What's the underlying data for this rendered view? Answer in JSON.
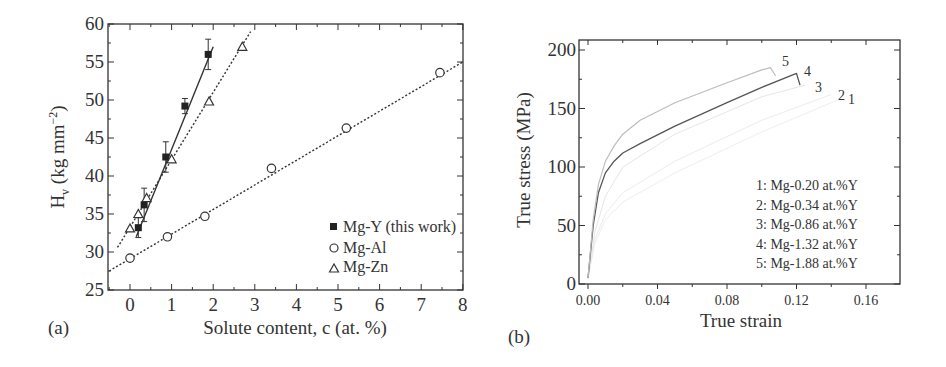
{
  "chart_data": [
    {
      "panel": "(a)",
      "type": "scatter",
      "title": "",
      "xlabel": "Solute content, c (at. %)",
      "ylabel": "H_v (kg mm^-2)",
      "xlim": [
        -0.5,
        8
      ],
      "ylim": [
        25,
        60
      ],
      "xticks": [
        0,
        1,
        2,
        3,
        4,
        5,
        6,
        7,
        8
      ],
      "yticks": [
        25,
        30,
        35,
        40,
        45,
        50,
        55,
        60
      ],
      "legend_position": "lower right",
      "series": [
        {
          "name": "Mg-Y (this work)",
          "marker": "filled-square",
          "fit": "solid",
          "x": [
            0.2,
            0.34,
            0.86,
            1.32,
            1.88
          ],
          "y": [
            33.2,
            36.2,
            42.5,
            49.2,
            56.0
          ],
          "yerr": [
            1.3,
            2.2,
            2.0,
            1.0,
            2.0
          ],
          "fit_line": [
            [
              0.15,
              32.0
            ],
            [
              2.0,
              57.0
            ]
          ]
        },
        {
          "name": "Mg-Al",
          "marker": "open-circle",
          "fit": "dotted",
          "x": [
            0.0,
            0.9,
            1.8,
            3.4,
            5.2,
            7.45
          ],
          "y": [
            29.2,
            32.0,
            34.7,
            41.0,
            46.3,
            53.6
          ],
          "fit_line": [
            [
              -0.5,
              27.5
            ],
            [
              8.0,
              55.0
            ]
          ]
        },
        {
          "name": "Mg-Zn",
          "marker": "open-triangle",
          "fit": "dotted",
          "x": [
            0.0,
            0.2,
            0.4,
            1.0,
            1.9,
            2.7
          ],
          "y": [
            33.1,
            35.0,
            37.1,
            42.2,
            49.8,
            57.0
          ],
          "fit_line": [
            [
              -0.3,
              30.6
            ],
            [
              2.9,
              59.0
            ]
          ]
        }
      ]
    },
    {
      "panel": "(b)",
      "type": "line",
      "title": "",
      "xlabel": "True strain",
      "ylabel": "True stress (MPa)",
      "xlim": [
        -0.008,
        0.178
      ],
      "ylim": [
        0,
        210
      ],
      "xticks": [
        "0.00",
        "0.04",
        "0.08",
        "0.12",
        "0.16"
      ],
      "yticks": [
        0,
        50,
        100,
        150,
        200
      ],
      "legend_position": "lower right (text list)",
      "series": [
        {
          "name": "1: Mg-0.20 at.%Y",
          "label": "1",
          "x": [
            0.0,
            0.004,
            0.01,
            0.02,
            0.05,
            0.1,
            0.145
          ],
          "y": [
            5,
            35,
            55,
            70,
            95,
            130,
            158
          ]
        },
        {
          "name": "2: Mg-0.34 at.%Y",
          "label": "2",
          "x": [
            0.0,
            0.004,
            0.01,
            0.02,
            0.05,
            0.1,
            0.14
          ],
          "y": [
            5,
            38,
            60,
            78,
            105,
            140,
            162
          ]
        },
        {
          "name": "3: Mg-0.86 at.%Y",
          "label": "3",
          "x": [
            0.0,
            0.004,
            0.01,
            0.02,
            0.05,
            0.1,
            0.125
          ],
          "y": [
            5,
            45,
            75,
            100,
            128,
            160,
            170
          ]
        },
        {
          "name": "4: Mg-1.32 at.%Y",
          "label": "4",
          "x": [
            0.0,
            0.003,
            0.006,
            0.01,
            0.015,
            0.02,
            0.03,
            0.05,
            0.08,
            0.1,
            0.12,
            0.122
          ],
          "y": [
            5,
            50,
            78,
            95,
            105,
            112,
            120,
            135,
            155,
            168,
            180,
            170
          ]
        },
        {
          "name": "5: Mg-1.88 at.%Y",
          "label": "5",
          "x": [
            0.0,
            0.003,
            0.006,
            0.01,
            0.015,
            0.02,
            0.03,
            0.05,
            0.08,
            0.1,
            0.105,
            0.108
          ],
          "y": [
            5,
            55,
            85,
            105,
            118,
            128,
            140,
            155,
            172,
            183,
            185,
            178
          ]
        }
      ]
    }
  ],
  "panel_a": {
    "label": "(a)",
    "xlabel": "Solute content, c (at. %)",
    "ylabel_main": "H",
    "ylabel_sub": "v",
    "ylabel_rest": " (kg mm",
    "ylabel_sup": "−2",
    "ylabel_end": ")",
    "xticks": [
      "0",
      "1",
      "2",
      "3",
      "4",
      "5",
      "6",
      "7",
      "8"
    ],
    "yticks": [
      "25",
      "30",
      "35",
      "40",
      "45",
      "50",
      "55",
      "60"
    ],
    "legend": [
      "Mg-Y (this work)",
      "Mg-Al",
      "Mg-Zn"
    ]
  },
  "panel_b": {
    "label": "(b)",
    "xlabel": "True strain",
    "ylabel": "True stress (MPa)",
    "xticks": [
      "0.00",
      "0.04",
      "0.08",
      "0.12",
      "0.16"
    ],
    "yticks": [
      "0",
      "50",
      "100",
      "150",
      "200"
    ],
    "legend": [
      "1: Mg-0.20 at.%Y",
      "2: Mg-0.34 at.%Y",
      "3: Mg-0.86 at.%Y",
      "4: Mg-1.32 at.%Y",
      "5: Mg-1.88 at.%Y"
    ],
    "curve_labels": [
      "1",
      "2",
      "3",
      "4",
      "5"
    ]
  }
}
